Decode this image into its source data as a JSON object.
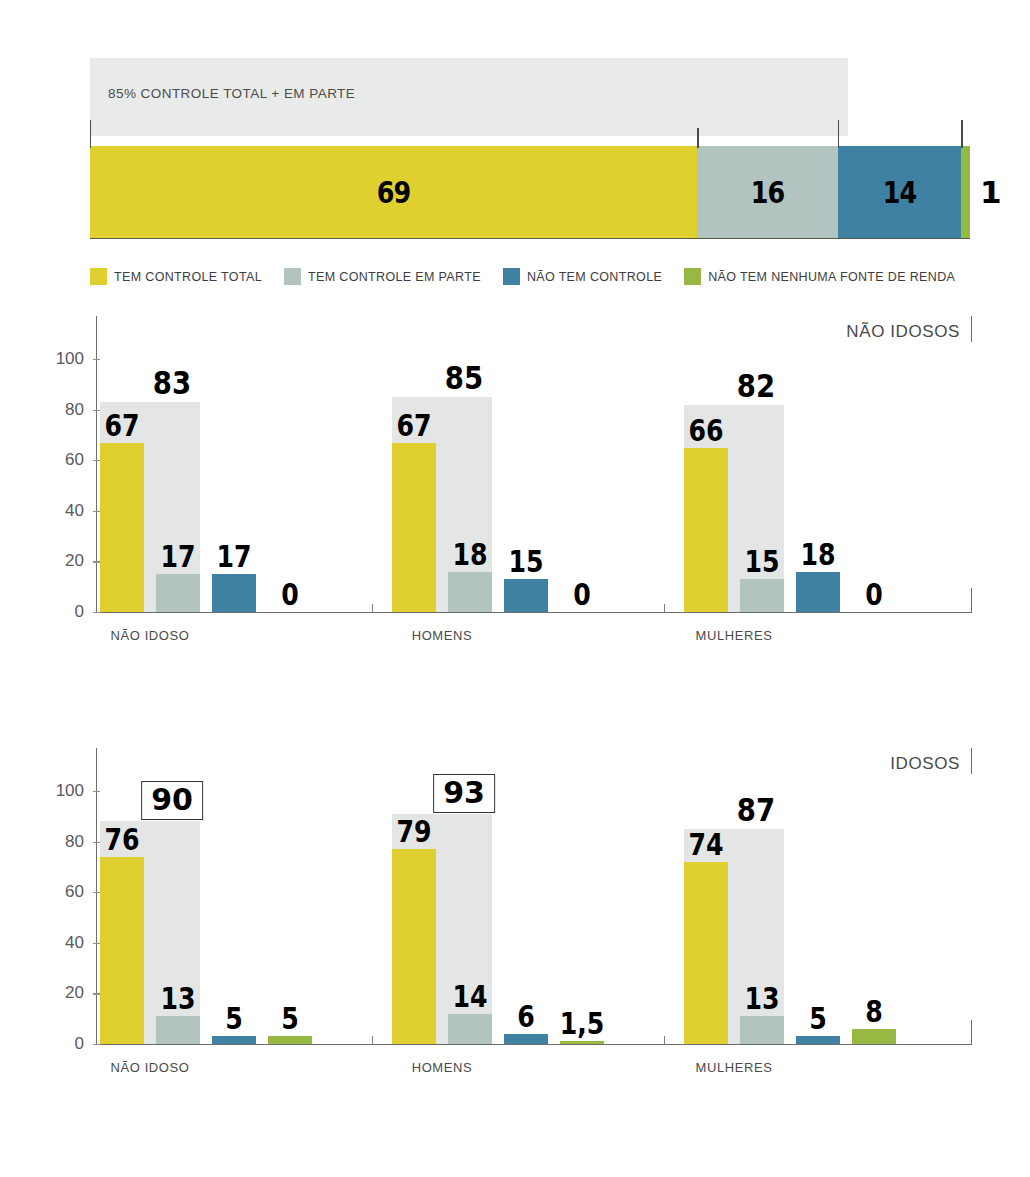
{
  "top_bar": {
    "header_note": "85% CONTROLE TOTAL + EM PARTE",
    "segments": [
      {
        "label": "69",
        "value": 69,
        "color": "#dfd02f"
      },
      {
        "label": "16",
        "value": 16,
        "color": "#b2c4c0"
      },
      {
        "label": "14",
        "value": 14,
        "color": "#3e81a3"
      },
      {
        "label": "1",
        "value": 1,
        "color": "#97b843"
      }
    ]
  },
  "legend": {
    "items": [
      {
        "label": "TEM CONTROLE TOTAL",
        "color": "#dfd02f"
      },
      {
        "label": "TEM CONTROLE EM PARTE",
        "color": "#b2c4c0"
      },
      {
        "label": "NÃO TEM CONTROLE",
        "color": "#3e81a3"
      },
      {
        "label": "NÃO TEM NENHUMA FONTE DE RENDA",
        "color": "#97b843"
      }
    ]
  },
  "panels": [
    {
      "title": "NÃO IDOSOS",
      "yticks": [
        "0",
        "20",
        "40",
        "60",
        "80",
        "100"
      ],
      "groups": [
        {
          "label": "NÃO IDOSO",
          "total_label": "83",
          "total_value": 83,
          "total_boxed": false,
          "bars": [
            {
              "label": "67",
              "value": 67,
              "color": "#dfd02f"
            },
            {
              "label": "17",
              "value": 15,
              "color": "#b2c4c0"
            },
            {
              "label": "17",
              "value": 15,
              "color": "#3e81a3"
            },
            {
              "label": "0",
              "value": 0,
              "color": "#97b843"
            }
          ]
        },
        {
          "label": "HOMENS",
          "total_label": "85",
          "total_value": 85,
          "total_boxed": false,
          "bars": [
            {
              "label": "67",
              "value": 67,
              "color": "#dfd02f"
            },
            {
              "label": "18",
              "value": 16,
              "color": "#b2c4c0"
            },
            {
              "label": "15",
              "value": 13,
              "color": "#3e81a3"
            },
            {
              "label": "0",
              "value": 0,
              "color": "#97b843"
            }
          ]
        },
        {
          "label": "MULHERES",
          "total_label": "82",
          "total_value": 82,
          "total_boxed": false,
          "bars": [
            {
              "label": "66",
              "value": 65,
              "color": "#dfd02f"
            },
            {
              "label": "15",
              "value": 13,
              "color": "#b2c4c0"
            },
            {
              "label": "18",
              "value": 16,
              "color": "#3e81a3"
            },
            {
              "label": "0",
              "value": 0,
              "color": "#97b843"
            }
          ]
        }
      ]
    },
    {
      "title": "IDOSOS",
      "yticks": [
        "0",
        "20",
        "40",
        "60",
        "80",
        "100"
      ],
      "groups": [
        {
          "label": "NÃO IDOSO",
          "total_label": "90",
          "total_value": 88,
          "total_boxed": true,
          "bars": [
            {
              "label": "76",
              "value": 74,
              "color": "#dfd02f"
            },
            {
              "label": "13",
              "value": 11,
              "color": "#b2c4c0"
            },
            {
              "label": "5",
              "value": 3,
              "color": "#3e81a3"
            },
            {
              "label": "5",
              "value": 3,
              "color": "#97b843"
            }
          ]
        },
        {
          "label": "HOMENS",
          "total_label": "93",
          "total_value": 91,
          "total_boxed": true,
          "bars": [
            {
              "label": "79",
              "value": 77,
              "color": "#dfd02f"
            },
            {
              "label": "14",
              "value": 12,
              "color": "#b2c4c0"
            },
            {
              "label": "6",
              "value": 4,
              "color": "#3e81a3"
            },
            {
              "label": "1,5",
              "value": 1,
              "color": "#97b843"
            }
          ]
        },
        {
          "label": "MULHERES",
          "total_label": "87",
          "total_value": 85,
          "total_boxed": false,
          "bars": [
            {
              "label": "74",
              "value": 72,
              "color": "#dfd02f"
            },
            {
              "label": "13",
              "value": 11,
              "color": "#b2c4c0"
            },
            {
              "label": "5",
              "value": 3,
              "color": "#3e81a3"
            },
            {
              "label": "8",
              "value": 6,
              "color": "#97b843"
            }
          ]
        }
      ]
    }
  ],
  "chart_data": [
    {
      "type": "bar",
      "title": "85% CONTROLE TOTAL + EM PARTE",
      "subtitle": "Controle sobre a renda — total da amostra (%)",
      "categories": [
        "TEM CONTROLE TOTAL",
        "TEM CONTROLE EM PARTE",
        "NÃO TEM CONTROLE",
        "NÃO TEM NENHUMA FONTE DE RENDA"
      ],
      "values": [
        69,
        16,
        14,
        1
      ],
      "xlabel": "",
      "ylabel": "",
      "ylim": [
        0,
        100
      ],
      "grid": false,
      "legend_position": "bottom",
      "orientation": "horizontal-stacked"
    },
    {
      "type": "bar",
      "title": "NÃO IDOSOS",
      "categories": [
        "NÃO IDOSO",
        "HOMENS",
        "MULHERES"
      ],
      "series": [
        {
          "name": "TEM CONTROLE TOTAL",
          "values": [
            67,
            67,
            66
          ],
          "color": "#dfd02f"
        },
        {
          "name": "TEM CONTROLE EM PARTE",
          "values": [
            17,
            18,
            15
          ],
          "color": "#b2c4c0"
        },
        {
          "name": "NÃO TEM CONTROLE",
          "values": [
            17,
            15,
            18
          ],
          "color": "#3e81a3"
        },
        {
          "name": "NÃO TEM NENHUMA FONTE DE RENDA",
          "values": [
            0,
            0,
            0
          ],
          "color": "#97b843"
        },
        {
          "name": "TOTAL CONTROLE (TOTAL + EM PARTE)",
          "values": [
            83,
            85,
            82
          ],
          "color": "#e4e6e6"
        }
      ],
      "xlabel": "",
      "ylabel": "",
      "ylim": [
        0,
        100
      ],
      "yticks": [
        0,
        20,
        40,
        60,
        80,
        100
      ],
      "grid": false,
      "legend_position": "top"
    },
    {
      "type": "bar",
      "title": "IDOSOS",
      "categories": [
        "NÃO IDOSO",
        "HOMENS",
        "MULHERES"
      ],
      "series": [
        {
          "name": "TEM CONTROLE TOTAL",
          "values": [
            76,
            79,
            74
          ],
          "color": "#dfd02f"
        },
        {
          "name": "TEM CONTROLE EM PARTE",
          "values": [
            13,
            14,
            13
          ],
          "color": "#b2c4c0"
        },
        {
          "name": "NÃO TEM CONTROLE",
          "values": [
            5,
            6,
            5
          ],
          "color": "#3e81a3"
        },
        {
          "name": "NÃO TEM NENHUMA FONTE DE RENDA",
          "values": [
            5,
            1.5,
            8
          ],
          "color": "#97b843"
        },
        {
          "name": "TOTAL CONTROLE (TOTAL + EM PARTE)",
          "values": [
            90,
            93,
            87
          ],
          "color": "#e4e6e6"
        }
      ],
      "annotations": [
        {
          "text": "90",
          "group": "NÃO IDOSO",
          "style": "boxed"
        },
        {
          "text": "93",
          "group": "HOMENS",
          "style": "boxed"
        }
      ],
      "xlabel": "",
      "ylabel": "",
      "ylim": [
        0,
        100
      ],
      "yticks": [
        0,
        20,
        40,
        60,
        80,
        100
      ],
      "grid": false,
      "legend_position": "top"
    }
  ]
}
